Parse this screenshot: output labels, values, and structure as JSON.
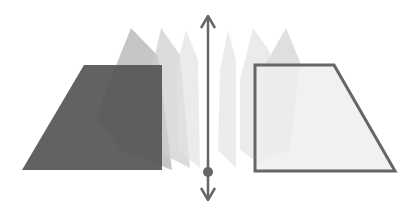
{
  "diagram": {
    "colors": {
      "background": "#ffffff",
      "left_page_fill": "#555555",
      "right_page_fill": "#eeeeee",
      "right_page_stroke": "#666666",
      "axis": "#666666",
      "intermediate_page_dark": "#b5b5b5",
      "intermediate_page_mid": "#cfcfcf",
      "intermediate_page_light": "#e2e2e2"
    },
    "axis": {
      "x": 208,
      "y_top": 16,
      "y_bottom": 200,
      "pivot_y": 172,
      "arrows": "both-ends"
    },
    "left_page": {
      "points": "84,65 162,65 162,170 22,170"
    },
    "right_page": {
      "points": "255,65 334,65 395,171 255,171"
    },
    "intermediate_pages_left": [
      {
        "points": "131,28 158,56 172,170 120,150 96,116",
        "opacity": 0.55
      },
      {
        "points": "161,28 180,55 190,168 154,150 146,96",
        "opacity": 0.45
      },
      {
        "points": "186,30 198,60 200,168 178,150 176,70",
        "opacity": 0.35
      }
    ],
    "intermediate_pages_right": [
      {
        "points": "228,30 236,60 236,168 218,150 220,70",
        "opacity": 0.3
      },
      {
        "points": "253,28 270,52 262,166 240,150 240,80",
        "opacity": 0.35
      },
      {
        "points": "286,28 300,62 290,150 262,160 262,70",
        "opacity": 0.35
      }
    ]
  }
}
